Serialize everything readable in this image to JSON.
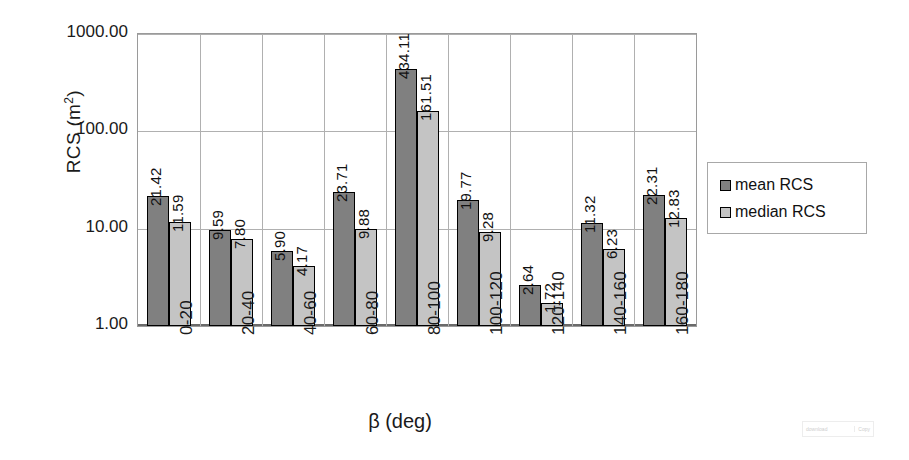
{
  "chart_data": {
    "type": "bar",
    "title": "",
    "xlabel": "β (deg)",
    "ylabel": "RCS (m²)",
    "yscale": "log",
    "ylim": [
      1.0,
      1000.0
    ],
    "yticks": [
      "1000.00",
      "100.00",
      "10.00",
      "1.00"
    ],
    "ytick_values": [
      1000.0,
      100.0,
      10.0,
      1.0
    ],
    "grid": "horizontal-and-vertical",
    "legend_position": "right",
    "categories": [
      "0-20",
      "20-40",
      "40-60",
      "60-80",
      "80-100",
      "100-120",
      "120-140",
      "140-160",
      "160-180"
    ],
    "series": [
      {
        "name": "mean RCS",
        "color": "#808080",
        "values": [
          21.42,
          9.59,
          5.9,
          23.71,
          434.11,
          19.77,
          2.64,
          11.32,
          22.31
        ],
        "labels": [
          "21.42",
          "9.59",
          "5.90",
          "23.71",
          "434.11",
          "19.77",
          "2.64",
          "11.32",
          "22.31"
        ]
      },
      {
        "name": "median RCS",
        "color": "#c4c4c4",
        "values": [
          11.59,
          7.8,
          4.17,
          9.88,
          161.51,
          9.28,
          1.72,
          6.23,
          12.83
        ],
        "labels": [
          "11.59",
          "7.80",
          "4.17",
          "9.88",
          "161.51",
          "9.28",
          "1.72",
          "6.23",
          "12.83"
        ]
      }
    ]
  },
  "legend": {
    "items": [
      {
        "label": "mean RCS",
        "color": "#808080"
      },
      {
        "label": "median RCS",
        "color": "#c4c4c4"
      }
    ]
  },
  "watermark": {
    "left_text": "download",
    "right_text": "Copy"
  }
}
